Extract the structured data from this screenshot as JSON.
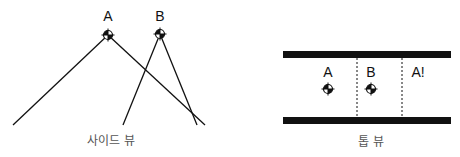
{
  "side_view": {
    "caption": "사이드 뷰",
    "points": [
      {
        "label": "A",
        "x": 108,
        "y": 35
      },
      {
        "label": "B",
        "x": 160,
        "y": 34
      }
    ]
  },
  "top_view": {
    "caption": "톱 뷰",
    "regions": [
      {
        "label": "A",
        "has_marker": true
      },
      {
        "label": "B",
        "has_marker": true
      },
      {
        "label": "A!",
        "has_marker": false
      }
    ]
  },
  "colors": {
    "line": "#111111",
    "caption": "#555555",
    "background": "#ffffff"
  }
}
